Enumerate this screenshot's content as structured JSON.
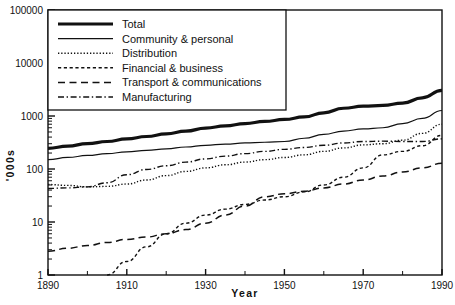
{
  "figure": {
    "background": "#ffffff",
    "ink": "#111111",
    "width": 455,
    "height": 305
  },
  "axes": {
    "x_title": "Year",
    "y_title": "'000s",
    "x_ticks": [
      "1890",
      "1910",
      "1930",
      "1950",
      "1970",
      "1990"
    ],
    "y_ticks": [
      "1",
      "10",
      "100",
      "1000",
      "10000",
      "100000"
    ]
  },
  "legend": {
    "items": [
      {
        "label": "Total",
        "style": "solid-thick",
        "color": "#111111"
      },
      {
        "label": "Community & personal",
        "style": "solid-thin",
        "color": "#111111"
      },
      {
        "label": "Distribution",
        "style": "dotted",
        "color": "#111111"
      },
      {
        "label": "Financial & business",
        "style": "dashed-short",
        "color": "#111111"
      },
      {
        "label": "Transport & communications",
        "style": "dashed-long",
        "color": "#111111"
      },
      {
        "label": "Manufacturing",
        "style": "dash-dot",
        "color": "#111111"
      }
    ]
  },
  "chart_data": {
    "type": "line",
    "title": "",
    "xlabel": "Year",
    "ylabel": "'000s",
    "xlim": [
      1890,
      1990
    ],
    "ylim": [
      1,
      100000
    ],
    "yscale": "log",
    "grid": false,
    "legend_position": "top-left",
    "x": [
      1890,
      1895,
      1900,
      1905,
      1910,
      1915,
      1920,
      1925,
      1930,
      1935,
      1940,
      1945,
      1950,
      1955,
      1960,
      1965,
      1970,
      1975,
      1980,
      1985,
      1990
    ],
    "series": [
      {
        "name": "Total",
        "style": "solid-thick",
        "values": [
          245,
          270,
          300,
          330,
          370,
          410,
          460,
          520,
          590,
          650,
          720,
          790,
          860,
          960,
          1150,
          1400,
          1530,
          1580,
          1750,
          2200,
          3050
        ]
      },
      {
        "name": "Community & personal",
        "style": "solid-thin",
        "values": [
          150,
          165,
          180,
          195,
          210,
          225,
          240,
          260,
          280,
          295,
          310,
          320,
          330,
          380,
          450,
          520,
          570,
          600,
          720,
          900,
          1270
        ]
      },
      {
        "name": "Distribution",
        "style": "dotted",
        "values": [
          51,
          49,
          46,
          47,
          52,
          62,
          75,
          90,
          105,
          120,
          135,
          150,
          165,
          185,
          215,
          250,
          285,
          300,
          350,
          470,
          700
        ]
      },
      {
        "name": "Financial & business",
        "style": "dashed-short",
        "values": [
          null,
          null,
          null,
          1.0,
          1.8,
          3.4,
          6.0,
          9.5,
          13.5,
          17.5,
          21.5,
          26,
          30,
          37,
          50,
          70,
          105,
          185,
          215,
          275,
          430
        ]
      },
      {
        "name": "Transport & communications",
        "style": "dashed-long",
        "values": [
          2.8,
          3.2,
          3.6,
          4.1,
          4.7,
          5.2,
          6.0,
          7.2,
          9.5,
          13.5,
          20,
          30,
          34,
          38,
          44,
          52,
          62,
          74,
          88,
          105,
          128
        ]
      },
      {
        "name": "Manufacturing",
        "style": "dash-dot",
        "values": [
          43,
          44,
          46,
          55,
          78,
          98,
          115,
          135,
          155,
          175,
          195,
          215,
          235,
          255,
          280,
          310,
          330,
          335,
          330,
          330,
          370
        ]
      }
    ]
  }
}
